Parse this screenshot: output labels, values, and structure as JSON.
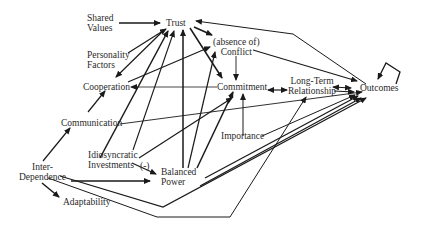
{
  "diagram": {
    "type": "causal-model",
    "nodes": [
      {
        "id": "shared_values",
        "label": "Shared\nValues"
      },
      {
        "id": "trust",
        "label": "Trust"
      },
      {
        "id": "personality_factors",
        "label": "Personality\nFactors"
      },
      {
        "id": "conflict",
        "label": "(absence of)\nConflict"
      },
      {
        "id": "cooperation",
        "label": "Cooperation"
      },
      {
        "id": "commitment",
        "label": "Commitment"
      },
      {
        "id": "long_term_relationship",
        "label": "Long-Term\nRelationship"
      },
      {
        "id": "outcomes",
        "label": "Outcomes"
      },
      {
        "id": "communication",
        "label": "Communication"
      },
      {
        "id": "importance",
        "label": "Importance"
      },
      {
        "id": "idiosyncratic_investments",
        "label": "Idiosyncratic\nInvestments"
      },
      {
        "id": "negative_sign",
        "label": "(-)"
      },
      {
        "id": "inter_dependence",
        "label": "Inter-\nDependence"
      },
      {
        "id": "balanced_power",
        "label": "Balanced\nPower"
      },
      {
        "id": "adaptability",
        "label": "Adaptability"
      }
    ],
    "edges": [
      {
        "from": "shared_values",
        "to": "trust"
      },
      {
        "from": "personality_factors",
        "to": "trust"
      },
      {
        "from": "personality_factors",
        "to": "cooperation"
      },
      {
        "from": "trust",
        "to": "conflict"
      },
      {
        "from": "trust",
        "to": "commitment"
      },
      {
        "from": "outcomes",
        "to": "trust"
      },
      {
        "from": "cooperation",
        "to": "conflict"
      },
      {
        "from": "conflict",
        "to": "commitment"
      },
      {
        "from": "conflict",
        "to": "outcomes"
      },
      {
        "from": "commitment",
        "to": "cooperation"
      },
      {
        "from": "commitment",
        "to": "long_term_relationship",
        "bidirectional": true
      },
      {
        "from": "long_term_relationship",
        "to": "outcomes",
        "bidirectional": true
      },
      {
        "from": "communication",
        "to": "cooperation"
      },
      {
        "from": "communication",
        "to": "trust"
      },
      {
        "from": "communication",
        "to": "outcomes"
      },
      {
        "from": "idiosyncratic_investments",
        "to": "trust"
      },
      {
        "from": "idiosyncratic_investments",
        "to": "commitment"
      },
      {
        "from": "idiosyncratic_investments",
        "to": "balanced_power",
        "label": "(-)"
      },
      {
        "from": "inter_dependence",
        "to": "communication"
      },
      {
        "from": "inter_dependence",
        "to": "balanced_power"
      },
      {
        "from": "inter_dependence",
        "to": "adaptability"
      },
      {
        "from": "inter_dependence",
        "to": "outcomes"
      },
      {
        "from": "balanced_power",
        "to": "trust"
      },
      {
        "from": "balanced_power",
        "to": "conflict"
      },
      {
        "from": "balanced_power",
        "to": "commitment"
      },
      {
        "from": "balanced_power",
        "to": "outcomes"
      },
      {
        "from": "importance",
        "to": "commitment"
      },
      {
        "from": "importance",
        "to": "outcomes"
      },
      {
        "from": "adaptability",
        "to": "long_term_relationship"
      },
      {
        "from": "outcomes",
        "to": "outcomes",
        "self_loop": true
      }
    ]
  }
}
